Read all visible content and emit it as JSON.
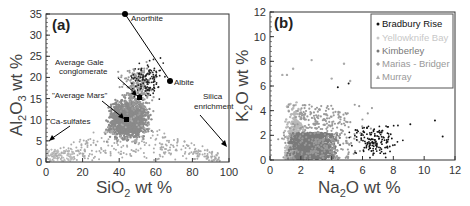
{
  "chart_data": [
    {
      "type": "scatter",
      "panel": "(a)",
      "xlabel": "SiO2 wt %",
      "ylabel": "Al2O3 wt %",
      "xlim": [
        0,
        100
      ],
      "ylim": [
        0,
        35
      ],
      "xticks": [
        0,
        20,
        40,
        60,
        80,
        100
      ],
      "yticks": [
        0,
        5,
        10,
        15,
        20,
        25,
        30,
        35
      ],
      "annotations": [
        {
          "text": "Anorthite",
          "x": 43,
          "y": 35
        },
        {
          "text": "Albite",
          "x": 68,
          "y": 19
        },
        {
          "text": "Average Gale conglomerate",
          "x": 51,
          "y": 15
        },
        {
          "text": "\"Average Mars\"",
          "x": 44,
          "y": 10
        },
        {
          "text": "Silica enrichment",
          "x": 97,
          "y": 4
        },
        {
          "text": "Ca-sulfates",
          "x": 2,
          "y": 5
        }
      ],
      "reference_points": [
        {
          "name": "Anorthite",
          "x": 43,
          "y": 35
        },
        {
          "name": "Albite",
          "x": 68,
          "y": 19
        },
        {
          "name": "Average Gale conglomerate",
          "x": 51,
          "y": 15.3
        },
        {
          "name": "Average Mars",
          "x": 44,
          "y": 9.8
        }
      ],
      "series": [
        {
          "name": "Bradbury Rise",
          "color": "#111111"
        },
        {
          "name": "Yellowknife Bay",
          "color": "#bbbbbb"
        },
        {
          "name": "Kimberley",
          "color": "#777777"
        },
        {
          "name": "Marias - Bridger",
          "color": "#999999"
        },
        {
          "name": "Murray",
          "color": "#aaaaaa"
        }
      ],
      "grid": false
    },
    {
      "type": "scatter",
      "panel": "(b)",
      "xlabel": "Na2O wt %",
      "ylabel": "K2O wt %",
      "xlim": [
        0,
        12
      ],
      "ylim": [
        0,
        12
      ],
      "xticks": [
        0,
        2,
        4,
        6,
        8,
        10,
        12
      ],
      "yticks": [
        0,
        2,
        4,
        6,
        8,
        10,
        12
      ],
      "legend_position": "upper right",
      "series": [
        {
          "name": "Bradbury Rise",
          "color": "#111111",
          "marker": "circle"
        },
        {
          "name": "Yellowknife Bay",
          "color": "#bbbbbb",
          "marker": "circle"
        },
        {
          "name": "Kimberley",
          "color": "#777777",
          "marker": "circle"
        },
        {
          "name": "Marias - Bridger",
          "color": "#999999",
          "marker": "diamond"
        },
        {
          "name": "Murray",
          "color": "#aaaaaa",
          "marker": "triangle"
        }
      ],
      "grid": false
    }
  ],
  "panel_a": {
    "label": "(a)",
    "xlabel_main": "SiO",
    "xlabel_sub": "2",
    "xlabel_rest": " wt %",
    "ylabel_main": "Al",
    "ylabel_sub1": "2",
    "ylabel_mid": "O",
    "ylabel_sub2": "3",
    "ylabel_rest": " wt %",
    "xticks": [
      "0",
      "20",
      "40",
      "60",
      "80",
      "100"
    ],
    "yticks": [
      "0",
      "5",
      "10",
      "15",
      "20",
      "25",
      "30",
      "35"
    ],
    "ann": {
      "anorthite": "Anorthite",
      "albite": "Albite",
      "gale1": "Average Gale",
      "gale2": "conglomerate",
      "mars": "\"Average Mars\"",
      "silica1": "Silica",
      "silica2": "enrichment",
      "casulf": "Ca-sulfates"
    }
  },
  "panel_b": {
    "label": "(b)",
    "xlabel_main": "Na",
    "xlabel_sub": "2",
    "xlabel_rest": "O wt %",
    "ylabel_main": "K",
    "ylabel_sub": "2",
    "ylabel_rest": "O wt %",
    "xticks": [
      "0",
      "2",
      "4",
      "6",
      "8",
      "10",
      "12"
    ],
    "yticks": [
      "0",
      "2",
      "4",
      "6",
      "8",
      "10",
      "12"
    ],
    "legend": [
      "Bradbury Rise",
      "Yellowknife Bay",
      "Kimberley",
      "Marias - Bridger",
      "Murray"
    ]
  }
}
